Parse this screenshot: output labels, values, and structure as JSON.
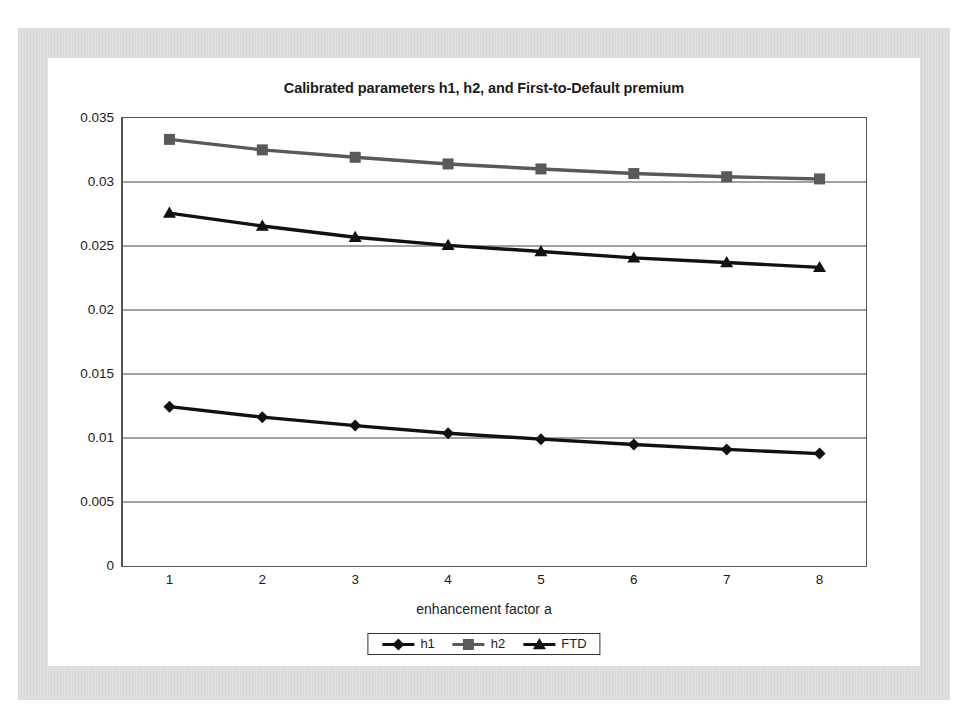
{
  "chart_data": {
    "type": "line",
    "title": "Calibrated parameters h1, h2, and First-to-Default premium",
    "xlabel": "enhancement factor a",
    "ylabel": "",
    "x": [
      1,
      2,
      3,
      4,
      5,
      6,
      7,
      8
    ],
    "xticklabels": [
      "1",
      "2",
      "3",
      "4",
      "5",
      "6",
      "7",
      "8"
    ],
    "yticks": [
      0,
      0.005,
      0.01,
      0.015,
      0.02,
      0.025,
      0.03,
      0.035
    ],
    "yticklabels": [
      "0",
      "0.005",
      "0.01",
      "0.015",
      "0.02",
      "0.025",
      "0.03",
      "0.035"
    ],
    "ylim": [
      0,
      0.035
    ],
    "grid": "horizontal",
    "legend_position": "bottom",
    "series": [
      {
        "name": "h1",
        "marker": "diamond",
        "color": "#111111",
        "values": [
          0.01245,
          0.01163,
          0.01097,
          0.01037,
          0.00991,
          0.00949,
          0.00911,
          0.00878
        ]
      },
      {
        "name": "h2",
        "marker": "square",
        "color": "#595959",
        "values": [
          0.03333,
          0.03251,
          0.03193,
          0.03141,
          0.03102,
          0.03066,
          0.03041,
          0.03024
        ]
      },
      {
        "name": "FTD",
        "marker": "triangle",
        "color": "#111111",
        "values": [
          0.02757,
          0.02656,
          0.02568,
          0.02505,
          0.02457,
          0.02407,
          0.02371,
          0.02333
        ]
      }
    ]
  },
  "legend": {
    "items": [
      {
        "label": "h1"
      },
      {
        "label": "h2"
      },
      {
        "label": "FTD"
      }
    ]
  }
}
